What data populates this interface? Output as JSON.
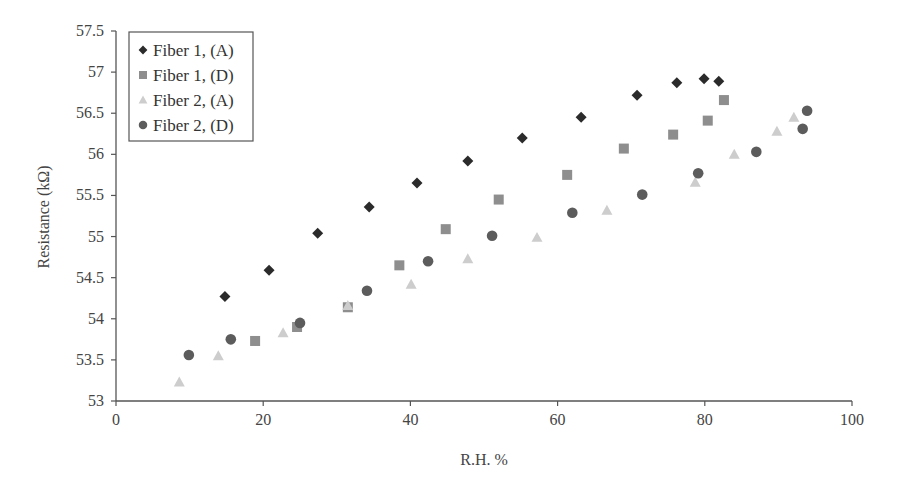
{
  "chart_data": {
    "type": "scatter",
    "title": "",
    "xlabel": "R.H. %",
    "ylabel": "Resistance (kΩ)",
    "xlim": [
      0,
      100
    ],
    "ylim": [
      53,
      57.5
    ],
    "xticks": [
      0,
      20,
      40,
      60,
      80,
      100
    ],
    "yticks": [
      53,
      53.5,
      54,
      54.5,
      55,
      55.5,
      56,
      56.5,
      57,
      57.5
    ],
    "xtick_labels": [
      "0",
      "20",
      "40",
      "60",
      "80",
      "100"
    ],
    "ytick_labels": [
      "53",
      "53.5",
      "54",
      "54.5",
      "55",
      "55.5",
      "56",
      "56.5",
      "57",
      "57.5"
    ],
    "grid": false,
    "legend_position": "top-left",
    "series": [
      {
        "name": "Fiber 1, (A)",
        "marker": "diamond",
        "color": "#2b2b2b",
        "x": [
          14.8,
          20.8,
          27.4,
          34.4,
          40.9,
          47.8,
          55.2,
          63.2,
          70.8,
          76.2,
          79.9,
          81.9
        ],
        "y": [
          54.27,
          54.59,
          55.04,
          55.36,
          55.65,
          55.92,
          56.2,
          56.45,
          56.72,
          56.87,
          56.92,
          56.89
        ]
      },
      {
        "name": "Fiber 1, (D)",
        "marker": "square",
        "color": "#8e8e8e",
        "x": [
          18.9,
          24.6,
          31.5,
          38.5,
          44.8,
          52.0,
          61.3,
          69.0,
          75.7,
          80.4,
          82.6
        ],
        "y": [
          53.73,
          53.9,
          54.14,
          54.65,
          55.09,
          55.45,
          55.75,
          56.07,
          56.24,
          56.41,
          56.66
        ]
      },
      {
        "name": "Fiber 2, (A)",
        "marker": "triangle",
        "color": "#cdcdcd",
        "x": [
          8.6,
          13.9,
          22.7,
          31.5,
          40.1,
          47.8,
          57.2,
          66.7,
          78.7,
          84.0,
          89.8,
          92.1
        ],
        "y": [
          53.23,
          53.55,
          53.83,
          54.16,
          54.42,
          54.73,
          54.99,
          55.32,
          55.66,
          56.0,
          56.28,
          56.45
        ]
      },
      {
        "name": "Fiber 2, (D)",
        "marker": "circle",
        "color": "#5c5c5c",
        "x": [
          9.9,
          15.6,
          25.0,
          34.1,
          42.4,
          51.1,
          62.0,
          71.5,
          79.1,
          87.0,
          93.3,
          93.9
        ],
        "y": [
          53.56,
          53.75,
          53.95,
          54.34,
          54.7,
          55.01,
          55.29,
          55.51,
          55.77,
          56.03,
          56.31,
          56.53
        ]
      }
    ]
  },
  "axes": {
    "x_title": "R.H. %",
    "y_title": "Resistance (kΩ)"
  },
  "legend": {
    "items": [
      "Fiber 1, (A)",
      "Fiber 1, (D)",
      "Fiber 2, (A)",
      "Fiber 2, (D)"
    ]
  }
}
